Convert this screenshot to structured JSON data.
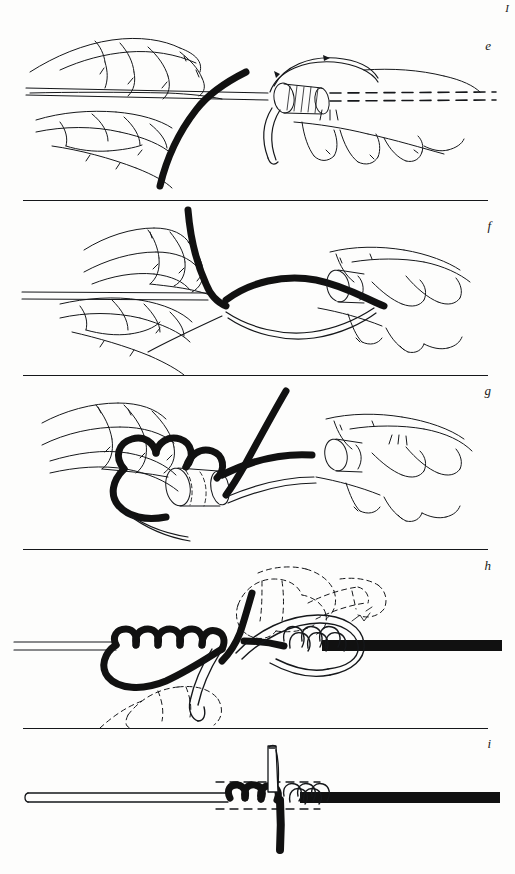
{
  "page": {
    "corner_mark": "I",
    "background_color": "#fdfdfc",
    "ink_color": "#15171a",
    "width": 515,
    "height": 874,
    "style": "pen-and-ink technical line drawing, scanned book page"
  },
  "panels": [
    {
      "id": "e",
      "label": "e",
      "label_top": 38,
      "top": 0,
      "height": 200,
      "caption_implied": "Hands holding the rope while the working end is passed around the standing part",
      "elements": [
        "left-hand-thumb-and-fingers",
        "right-hand-fingers",
        "rope-standing-part",
        "black-working-end",
        "dashed-hidden-rope-line",
        "loop-over-rope-end",
        "whipping-turn-hatching"
      ]
    },
    {
      "id": "f",
      "label": "f",
      "label_top": 218,
      "top": 200,
      "height": 175,
      "caption_implied": "The working end is brought up and over, forming a bight across the rope",
      "elements": [
        "left-hand-pinching-rope",
        "right-hand-holding-rope-end",
        "rope-standing-part",
        "black-working-end-vertical",
        "black-bight-loop",
        "thin-trailing-line"
      ]
    },
    {
      "id": "g",
      "label": "g",
      "label_top": 383,
      "top": 375,
      "height": 175,
      "caption_implied": "Turns are wound on tightly against the lay of the rope",
      "elements": [
        "left-hand-fingers",
        "right-hand-fingers",
        "rope-end-cylinder",
        "black-whipping-turns",
        "black-working-end-crossing",
        "thin-trailing-line"
      ]
    },
    {
      "id": "h",
      "label": "h",
      "label_top": 558,
      "top": 549,
      "height": 179,
      "caption_implied": "Both ends are hauled taut; ghosted dashed outlines show the hands pulling",
      "elements": [
        "rope-horizontal",
        "black-whipping-turns-left",
        "white-whipping-turns-right",
        "black-working-end",
        "white-loop",
        "dashed-ghost-hands",
        "dashed-ghost-rope-ends"
      ]
    },
    {
      "id": "i",
      "label": "i",
      "label_top": 736,
      "top": 728,
      "height": 146,
      "caption_implied": "The finished whipping, trimmed; dashed guides mark the whipping width",
      "elements": [
        "rope-horizontal",
        "black-whipping-turns",
        "white-whipping-turns",
        "knife-blade",
        "black-tail-end",
        "dashed-guide-lines"
      ]
    }
  ],
  "dividers": [
    {
      "name": "divider-e-f",
      "y": 200
    },
    {
      "name": "divider-f-g",
      "y": 375
    },
    {
      "name": "divider-g-h",
      "y": 549
    },
    {
      "name": "divider-h-i",
      "y": 728
    }
  ]
}
